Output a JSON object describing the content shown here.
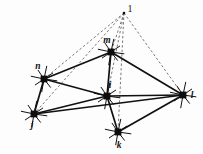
{
  "figure": {
    "background_color": "#fdfdfd",
    "line_color": "#111111",
    "dashed_color": "#555555",
    "node_fill": "#0d0d0d"
  },
  "labels": {
    "apex": "1",
    "m": "m",
    "n": "n",
    "i": "i",
    "l": "l",
    "j": "j",
    "k": "k"
  },
  "chart_data": {
    "type": "diagram",
    "nodes": [
      {
        "id": "apex",
        "label": "1",
        "x": 124,
        "y": 13,
        "marker": "apex-point",
        "label_dx": 6,
        "label_dy": -1
      },
      {
        "id": "m",
        "label": "m",
        "x": 111,
        "y": 52,
        "marker": "square-star",
        "label_dx": -4,
        "label_dy": -9
      },
      {
        "id": "n",
        "label": "n",
        "x": 44,
        "y": 79,
        "marker": "square-star",
        "label_dx": -6,
        "label_dy": -10
      },
      {
        "id": "i",
        "label": "i",
        "x": 107,
        "y": 96,
        "marker": "square-star",
        "label_dx": 3,
        "label_dy": -8
      },
      {
        "id": "l",
        "label": "l",
        "x": 183,
        "y": 95,
        "marker": "square-star",
        "label_dx": 9,
        "label_dy": 3
      },
      {
        "id": "j",
        "label": "j",
        "x": 34,
        "y": 114,
        "marker": "square-star",
        "label_dx": -2,
        "label_dy": 14
      },
      {
        "id": "k",
        "label": "k",
        "x": 118,
        "y": 132,
        "marker": "square-star",
        "label_dx": 1,
        "label_dy": 16
      }
    ],
    "solid_edges": [
      [
        "m",
        "n"
      ],
      [
        "m",
        "i"
      ],
      [
        "m",
        "l"
      ],
      [
        "n",
        "i"
      ],
      [
        "n",
        "j"
      ],
      [
        "i",
        "j"
      ],
      [
        "i",
        "l"
      ],
      [
        "i",
        "k"
      ],
      [
        "j",
        "l"
      ],
      [
        "k",
        "l"
      ]
    ],
    "dashed_edges": [
      [
        "apex",
        "n"
      ],
      [
        "apex",
        "j"
      ],
      [
        "apex",
        "m"
      ],
      [
        "apex",
        "i"
      ],
      [
        "apex",
        "k"
      ],
      [
        "apex",
        "l"
      ]
    ]
  }
}
